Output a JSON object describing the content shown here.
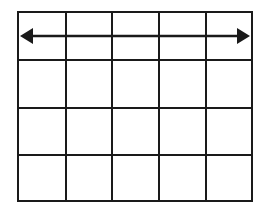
{
  "diagram": {
    "type": "grid-with-arrow",
    "rows": 4,
    "cols": 5,
    "line_color": "#1a1a1a",
    "background": "#ffffff",
    "grid": {
      "x_lines": [
        18,
        66,
        112,
        159,
        206,
        252
      ],
      "y_lines": [
        12,
        60,
        108,
        155,
        201
      ]
    },
    "arrow": {
      "kind": "double-headed",
      "direction": "horizontal",
      "row": 1,
      "y": 36,
      "x_start": 20,
      "x_end": 250,
      "color": "#1a1a1a"
    }
  }
}
